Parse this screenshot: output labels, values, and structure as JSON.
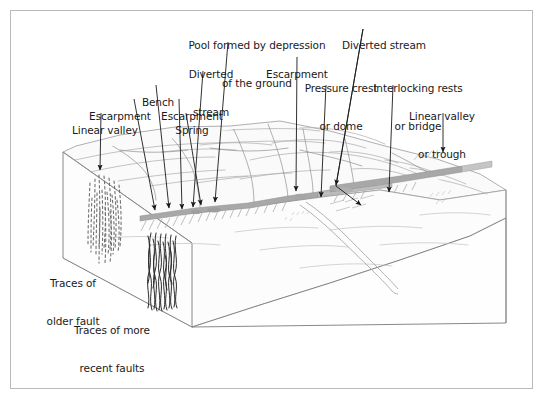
{
  "figure": {
    "type": "geologic-block-diagram",
    "border_color": "#b9b9b9",
    "background_color": "#ffffff",
    "ink_color": "#1a1a1a",
    "terrain_line_color": "#9a9a9a",
    "fault_band_color": "#b0b0b0",
    "block_face_color": "#fbfbfb"
  },
  "labels": [
    {
      "id": "pool-formed-by-depression",
      "name": "pool-formed-by-depression-of-the-ground",
      "lines": [
        "Pool formed by depression",
        "of the ground"
      ],
      "text_x": 257,
      "text_y": 14,
      "align": "center",
      "leader": {
        "x1": 228,
        "y1": 42,
        "x2": 215,
        "y2": 204
      }
    },
    {
      "id": "diverted-stream-right",
      "name": "diverted-stream-right",
      "lines": [
        "Diverted stream"
      ],
      "text_x": 384,
      "text_y": 14,
      "align": "center",
      "leader": {
        "x1": 363,
        "y1": 29,
        "x2": 336,
        "y2": 188
      },
      "leader2": {
        "x1": 336,
        "y1": 188,
        "x2": 362,
        "y2": 207
      }
    },
    {
      "id": "escarpment-mid",
      "name": "escarpment-middle",
      "lines": [
        "Escarpment"
      ],
      "text_x": 297,
      "text_y": 43,
      "align": "center",
      "leader": {
        "x1": 297,
        "y1": 57,
        "x2": 296,
        "y2": 193
      }
    },
    {
      "id": "diverted-stream-left",
      "name": "diverted-stream-left",
      "lines": [
        "Diverted",
        "stream"
      ],
      "text_x": 211,
      "text_y": 43,
      "align": "center",
      "leader": {
        "x1": 203,
        "y1": 71,
        "x2": 193,
        "y2": 209
      }
    },
    {
      "id": "pressure-crest",
      "name": "pressure-crest-or-dome",
      "lines": [
        "Pressure crest",
        "or dome"
      ],
      "text_x": 341,
      "text_y": 57,
      "align": "center",
      "leader": {
        "x1": 326,
        "y1": 85,
        "x2": 321,
        "y2": 199
      }
    },
    {
      "id": "interlocking-rests",
      "name": "interlocking-rests-or-bridge",
      "lines": [
        "Interlocking rests",
        "or bridge"
      ],
      "text_x": 418,
      "text_y": 57,
      "align": "center",
      "leader": {
        "x1": 393,
        "y1": 85,
        "x2": 389,
        "y2": 194
      }
    },
    {
      "id": "bench",
      "name": "bench",
      "lines": [
        "Bench"
      ],
      "text_x": 158,
      "text_y": 71,
      "align": "center",
      "leader": {
        "x1": 156,
        "y1": 85,
        "x2": 169,
        "y2": 210
      }
    },
    {
      "id": "escarpment-left",
      "name": "escarpment-left",
      "lines": [
        "Escarpment"
      ],
      "text_x": 120,
      "text_y": 85,
      "align": "center",
      "leader": {
        "x1": 134,
        "y1": 99,
        "x2": 155,
        "y2": 212
      }
    },
    {
      "id": "escarpment-left2",
      "name": "escarpment-second",
      "lines": [
        "Escarpment"
      ],
      "text_x": 192,
      "text_y": 85,
      "align": "center",
      "leader": {
        "x1": 179,
        "y1": 99,
        "x2": 182,
        "y2": 211
      }
    },
    {
      "id": "spring",
      "name": "spring",
      "lines": [
        "Spring"
      ],
      "text_x": 192,
      "text_y": 99,
      "align": "center",
      "leader": {
        "x1": 186,
        "y1": 113,
        "x2": 201,
        "y2": 207
      }
    },
    {
      "id": "linear-valley",
      "name": "linear-valley",
      "lines": [
        "Linear valley"
      ],
      "text_x": 105,
      "text_y": 99,
      "align": "center",
      "leader": {
        "x1": 101,
        "y1": 113,
        "x2": 100,
        "y2": 172
      }
    },
    {
      "id": "linear-valley-or-trough",
      "name": "linear-valley-or-trough",
      "lines": [
        "Linear valley",
        "or trough"
      ],
      "text_x": 442,
      "text_y": 85,
      "align": "center",
      "leader": {
        "x1": 443,
        "y1": 113,
        "x2": 443,
        "y2": 154
      }
    },
    {
      "id": "traces-older-fault",
      "name": "traces-of-older-fault",
      "lines": [
        "Traces of",
        "older fault"
      ],
      "text_x": 73,
      "text_y": 252,
      "align": "center",
      "leader": null
    },
    {
      "id": "traces-recent-faults",
      "name": "traces-of-more-recent-faults",
      "lines": [
        "Traces of more",
        "recent faults"
      ],
      "text_x": 112,
      "text_y": 299,
      "align": "center",
      "leader": null
    }
  ],
  "block": {
    "top_surface_note": "uplifted terrain with ridges and drainage lines",
    "fault_trace_note": "gray scarp band running diagonally across the block top",
    "left_face_note": "vertical cut face showing dashed older fault traces",
    "front_face_note": "vertical cut face of lowland block"
  }
}
